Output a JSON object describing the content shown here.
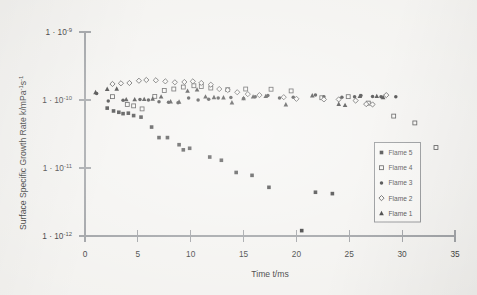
{
  "figure": {
    "background_color": "#f2f1ee",
    "ink_color": "#131313",
    "axis_color": "#8f9296"
  },
  "axes": {
    "x_title": "Time t/ms",
    "y_title_parts": {
      "main": "Surface Specific Growth Rate k/mPa",
      "sup1": "-1",
      "mid": "s",
      "sup2": "-1"
    },
    "y_title_full": "Surface Specific Growth Rate k/mPa-1s-1",
    "x_ticks": [
      "0",
      "5",
      "10",
      "15",
      "20",
      "25",
      "30",
      "35"
    ],
    "y_ticks": [
      "1 · 10-9",
      "1 · 10-10",
      "1 · 10-11",
      "1 · 10-12"
    ],
    "y_tick_mantissa": "1 · 10",
    "y_tick_exponents": [
      "-9",
      "-10",
      "-11",
      "-12"
    ]
  },
  "legend": {
    "items": [
      {
        "label": "Flame 5",
        "marker": "filled-square",
        "color": "#131313"
      },
      {
        "label": "Flame 4",
        "marker": "open-square",
        "color": "#2a2a2a"
      },
      {
        "label": "Flame 3",
        "marker": "filled-circle",
        "color": "#131313"
      },
      {
        "label": "Flame 2",
        "marker": "open-diamond",
        "color": "#2a2a2a"
      },
      {
        "label": "Flame 1",
        "marker": "filled-triangle",
        "color": "#131313"
      }
    ]
  },
  "chart_data": {
    "type": "scatter",
    "title": "",
    "xlabel": "Time t/ms",
    "ylabel": "Surface Specific Growth Rate k/mPa-1s-1",
    "xlim": [
      0,
      35
    ],
    "ylim": [
      1e-12,
      1e-09
    ],
    "yscale": "log",
    "xscale": "linear",
    "grid": false,
    "legend_position": "right-inside",
    "series": [
      {
        "name": "Flame 5",
        "marker": "filled-square",
        "color": "#131313",
        "points": [
          [
            2.1,
            7.6e-11
          ],
          [
            2.7,
            6.9e-11
          ],
          [
            3.2,
            6.6e-11
          ],
          [
            3.6,
            6.3e-11
          ],
          [
            4.1,
            6.4e-11
          ],
          [
            4.6,
            5.9e-11
          ],
          [
            5.3,
            5.6e-11
          ],
          [
            6.3,
            4e-11
          ],
          [
            7.0,
            2.8e-11
          ],
          [
            7.8,
            2.8e-11
          ],
          [
            8.9,
            2.2e-11
          ],
          [
            9.9,
            1.95e-11
          ],
          [
            9.3,
            1.85e-11
          ],
          [
            11.8,
            1.45e-11
          ],
          [
            12.9,
            1.3e-11
          ],
          [
            14.3,
            8.6e-12
          ],
          [
            15.8,
            7.8e-12
          ],
          [
            17.4,
            5.2e-12
          ],
          [
            21.8,
            4.4e-12
          ],
          [
            23.4,
            4.2e-12
          ],
          [
            20.5,
            1.2e-12
          ]
        ]
      },
      {
        "name": "Flame 4",
        "marker": "open-square",
        "color": "#2a2a2a",
        "points": [
          [
            2.6,
            1.12e-10
          ],
          [
            4.0,
            8.6e-11
          ],
          [
            4.6,
            8.2e-11
          ],
          [
            5.4,
            7.4e-11
          ],
          [
            6.6,
            1.13e-10
          ],
          [
            7.5,
            1.38e-10
          ],
          [
            8.4,
            1.45e-10
          ],
          [
            9.3,
            1.55e-10
          ],
          [
            10.3,
            1.62e-10
          ],
          [
            11.0,
            1.58e-10
          ],
          [
            11.9,
            1.5e-10
          ],
          [
            13.5,
            1.42e-10
          ],
          [
            15.2,
            1.45e-10
          ],
          [
            17.6,
            1.44e-10
          ],
          [
            19.5,
            1.36e-10
          ],
          [
            22.4,
            1.08e-10
          ],
          [
            24.9,
            1.12e-10
          ],
          [
            26.8,
            9e-11
          ],
          [
            29.2,
            5.8e-11
          ],
          [
            31.2,
            4.6e-11
          ],
          [
            33.2,
            2e-11
          ]
        ]
      },
      {
        "name": "Flame 3",
        "marker": "filled-circle",
        "color": "#131313",
        "points": [
          [
            1.1,
            1.25e-10
          ],
          [
            2.2,
            9.7e-11
          ],
          [
            3.6,
            9.9e-11
          ],
          [
            5.2,
            1.02e-10
          ],
          [
            6.0,
            1e-10
          ],
          [
            7.0,
            9.4e-11
          ],
          [
            7.9,
            9.3e-11
          ],
          [
            8.8,
            9.1e-11
          ],
          [
            9.8,
            1.07e-10
          ],
          [
            10.7,
            1e-10
          ],
          [
            11.7,
            1.03e-10
          ],
          [
            12.6,
            1.07e-10
          ],
          [
            13.8,
            1.09e-10
          ],
          [
            15.0,
            1.05e-10
          ],
          [
            16.1,
            1.12e-10
          ],
          [
            17.3,
            1.16e-10
          ],
          [
            18.4,
            1.07e-10
          ],
          [
            19.7,
            1.1e-10
          ],
          [
            21.8,
            1.18e-10
          ],
          [
            22.6,
            1.12e-10
          ],
          [
            24.3,
            1.1e-10
          ],
          [
            25.5,
            1.12e-10
          ],
          [
            26.1,
            1.16e-10
          ],
          [
            27.2,
            1.13e-10
          ],
          [
            28.0,
            1.12e-10
          ],
          [
            29.4,
            1.12e-10
          ]
        ]
      },
      {
        "name": "Flame 2",
        "marker": "open-diamond",
        "color": "#2a2a2a",
        "points": [
          [
            2.6,
            1.72e-10
          ],
          [
            3.4,
            1.76e-10
          ],
          [
            4.2,
            1.78e-10
          ],
          [
            5.1,
            1.92e-10
          ],
          [
            5.8,
            1.97e-10
          ],
          [
            6.7,
            1.95e-10
          ],
          [
            7.6,
            1.88e-10
          ],
          [
            8.5,
            1.82e-10
          ],
          [
            9.4,
            1.84e-10
          ],
          [
            10.2,
            1.88e-10
          ],
          [
            11.0,
            1.78e-10
          ],
          [
            11.9,
            1.68e-10
          ],
          [
            12.7,
            1.45e-10
          ],
          [
            13.5,
            1.4e-10
          ],
          [
            14.4,
            1.3e-10
          ],
          [
            15.4,
            1.22e-10
          ],
          [
            16.5,
            1.18e-10
          ],
          [
            18.8,
            1.1e-10
          ],
          [
            20.0,
            1.04e-10
          ],
          [
            22.6,
            1.02e-10
          ],
          [
            24.0,
            1.02e-10
          ],
          [
            25.6,
            9.8e-11
          ],
          [
            26.6,
            8.7e-11
          ],
          [
            27.2,
            8.6e-11
          ],
          [
            28.5,
            1.18e-10
          ]
        ]
      },
      {
        "name": "Flame 1",
        "marker": "filled-triangle",
        "color": "#131313",
        "points": [
          [
            1.0,
            1.3e-10
          ],
          [
            2.1,
            1.45e-10
          ],
          [
            3.0,
            1.46e-10
          ],
          [
            3.9,
            1.02e-10
          ],
          [
            4.7,
            1.02e-10
          ],
          [
            5.6,
            1.03e-10
          ],
          [
            6.4,
            1.04e-10
          ],
          [
            7.2,
            1.12e-10
          ],
          [
            8.1,
            9.5e-11
          ],
          [
            8.9,
            9.4e-11
          ],
          [
            9.7,
            1.36e-10
          ],
          [
            10.6,
            1.42e-10
          ],
          [
            11.4,
            1.12e-10
          ],
          [
            12.2,
            1.1e-10
          ],
          [
            13.1,
            1.09e-10
          ],
          [
            13.9,
            9.2e-11
          ],
          [
            15.0,
            1.06e-10
          ],
          [
            15.9,
            1.12e-10
          ],
          [
            17.1,
            1.14e-10
          ],
          [
            19.0,
            8.6e-11
          ],
          [
            21.5,
            1.16e-10
          ],
          [
            24.0,
            8.7e-11
          ],
          [
            24.6,
            8.4e-11
          ],
          [
            26.0,
            1.14e-10
          ],
          [
            27.6,
            1.14e-10
          ],
          [
            28.2,
            1.1e-10
          ]
        ]
      }
    ]
  }
}
